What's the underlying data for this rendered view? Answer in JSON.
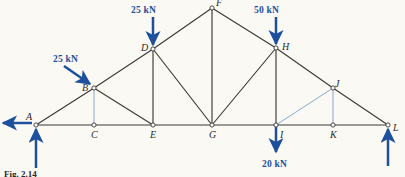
{
  "figure": {
    "caption": "Fig. 2.14",
    "background_color": "#fbf9f4",
    "member_color": "#3a3a38",
    "force_color": "#1d4f9e",
    "light_member_color": "#6f93c4",
    "width": 405,
    "height": 177
  },
  "chart_data": {
    "type": "diagram",
    "title": "Fig. 2.14",
    "subtype": "truss-free-body-diagram",
    "units": "kN",
    "joints": [
      {
        "id": "A",
        "x": 36,
        "y": 125,
        "label": "A",
        "label_dx": -10,
        "label_dy": -13
      },
      {
        "id": "B",
        "x": 94,
        "y": 88,
        "label": "B",
        "label_dx": -12,
        "label_dy": -5
      },
      {
        "id": "C",
        "x": 94,
        "y": 125,
        "label": "C",
        "label_dx": -3,
        "label_dy": 5
      },
      {
        "id": "D",
        "x": 153,
        "y": 49,
        "label": "D",
        "label_dx": -12,
        "label_dy": -6
      },
      {
        "id": "E",
        "x": 153,
        "y": 125,
        "label": "E",
        "label_dx": -3,
        "label_dy": 5
      },
      {
        "id": "F",
        "x": 212,
        "y": 8,
        "label": "F",
        "label_dx": 4,
        "label_dy": -10
      },
      {
        "id": "G",
        "x": 212,
        "y": 125,
        "label": "G",
        "label_dx": -3,
        "label_dy": 5
      },
      {
        "id": "H",
        "x": 276,
        "y": 48,
        "label": "H",
        "label_dx": 6,
        "label_dy": -6
      },
      {
        "id": "I",
        "x": 276,
        "y": 125,
        "label": "I",
        "label_dx": 4,
        "label_dy": 5
      },
      {
        "id": "J",
        "x": 333,
        "y": 88,
        "label": "J",
        "label_dx": 2,
        "label_dy": -9
      },
      {
        "id": "K",
        "x": 333,
        "y": 125,
        "label": "K",
        "label_dx": -3,
        "label_dy": 5
      },
      {
        "id": "L",
        "x": 388,
        "y": 125,
        "label": "L",
        "label_dx": 5,
        "label_dy": -2
      }
    ],
    "members": [
      {
        "from": "A",
        "to": "B",
        "style": "dark"
      },
      {
        "from": "B",
        "to": "D",
        "style": "dark"
      },
      {
        "from": "D",
        "to": "F",
        "style": "dark"
      },
      {
        "from": "F",
        "to": "H",
        "style": "dark"
      },
      {
        "from": "H",
        "to": "J",
        "style": "dark"
      },
      {
        "from": "J",
        "to": "L",
        "style": "dark"
      },
      {
        "from": "A",
        "to": "C",
        "style": "dark"
      },
      {
        "from": "C",
        "to": "E",
        "style": "dark"
      },
      {
        "from": "E",
        "to": "G",
        "style": "dark"
      },
      {
        "from": "G",
        "to": "I",
        "style": "dark"
      },
      {
        "from": "I",
        "to": "K",
        "style": "dark"
      },
      {
        "from": "K",
        "to": "L",
        "style": "dark"
      },
      {
        "from": "B",
        "to": "C",
        "style": "light"
      },
      {
        "from": "B",
        "to": "E",
        "style": "dark"
      },
      {
        "from": "D",
        "to": "E",
        "style": "dark"
      },
      {
        "from": "D",
        "to": "G",
        "style": "dark"
      },
      {
        "from": "F",
        "to": "G",
        "style": "dark"
      },
      {
        "from": "H",
        "to": "G",
        "style": "dark"
      },
      {
        "from": "H",
        "to": "I",
        "style": "dark"
      },
      {
        "from": "J",
        "to": "I",
        "style": "light"
      },
      {
        "from": "J",
        "to": "K",
        "style": "light"
      }
    ],
    "loads": [
      {
        "name": "load-at-B",
        "label": "25 kN",
        "joint": "B",
        "direction": "diagonal-down-right",
        "label_x": 53,
        "label_y": 55,
        "arrow": {
          "x1": 64,
          "y1": 66,
          "x2": 90,
          "y2": 84
        }
      },
      {
        "name": "load-at-D",
        "label": "25 kN",
        "joint": "D",
        "direction": "down",
        "label_x": 131,
        "label_y": 6,
        "arrow": {
          "x1": 153,
          "y1": 17,
          "x2": 153,
          "y2": 45
        }
      },
      {
        "name": "load-at-H",
        "label": "50 kN",
        "joint": "H",
        "direction": "down",
        "label_x": 254,
        "label_y": 6,
        "arrow": {
          "x1": 276,
          "y1": 17,
          "x2": 276,
          "y2": 44
        }
      },
      {
        "name": "load-at-I",
        "label": "20 kN",
        "joint": "I",
        "direction": "down",
        "label_x": 262,
        "label_y": 160,
        "arrow": {
          "x1": 276,
          "y1": 127,
          "x2": 276,
          "y2": 152
        }
      }
    ],
    "reactions": [
      {
        "name": "reaction-at-A-vertical",
        "joint": "A",
        "direction": "up",
        "arrow": {
          "x1": 36,
          "y1": 168,
          "x2": 36,
          "y2": 129
        }
      },
      {
        "name": "reaction-at-A-horizontal",
        "joint": "A",
        "direction": "left",
        "arrow": {
          "x1": 32,
          "y1": 123,
          "x2": 3,
          "y2": 123
        }
      },
      {
        "name": "reaction-at-L-vertical",
        "joint": "L",
        "direction": "up",
        "arrow": {
          "x1": 388,
          "y1": 166,
          "x2": 388,
          "y2": 129
        }
      }
    ],
    "joint_labels": [
      "A",
      "B",
      "C",
      "D",
      "E",
      "F",
      "G",
      "H",
      "I",
      "J",
      "K",
      "L"
    ],
    "load_labels": [
      "25 kN",
      "25 kN",
      "50 kN",
      "20 kN"
    ]
  }
}
